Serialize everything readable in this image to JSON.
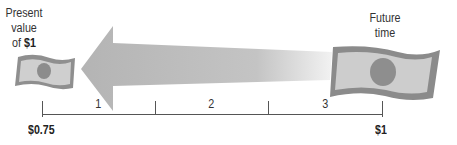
{
  "labels": {
    "present_line1": "Present",
    "present_line2": "value",
    "present_line3_prefix": "of ",
    "present_line3_bold": "$1",
    "future_line1": "Future",
    "future_line2": "time"
  },
  "timeline": {
    "periods": [
      "1",
      "2",
      "3"
    ],
    "start_value": "$0.75",
    "end_value": "$1"
  },
  "icons": {
    "small_bill": "dollar-bill-icon",
    "large_bill": "dollar-bill-icon",
    "arrow": "left-arrow-icon"
  },
  "colors": {
    "bill_border": "#8a8a8a",
    "bill_fill": "#c8c8c8",
    "bill_portrait": "#8f8f8f",
    "arrow_fill": "#b9b9b9",
    "timeline_line": "#555555"
  }
}
